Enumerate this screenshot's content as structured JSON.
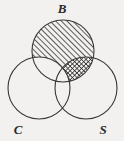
{
  "figure": {
    "type": "venn-diagram",
    "background_color": "#f2f1ef",
    "stroke_color": "#3a3836",
    "hatch_color": "#2b2a28",
    "sets": [
      {
        "id": "B",
        "label": "B",
        "label_position": "top-center",
        "label_x": 62,
        "label_y": 13,
        "circle": {
          "cx": 63,
          "cy": 51,
          "r": 31
        }
      },
      {
        "id": "C",
        "label": "C",
        "label_position": "bottom-left",
        "label_x": 18,
        "label_y": 134,
        "circle": {
          "cx": 39,
          "cy": 88,
          "r": 31
        }
      },
      {
        "id": "S",
        "label": "S",
        "label_position": "bottom-right",
        "label_x": 103,
        "label_y": 134,
        "circle": {
          "cx": 86,
          "cy": 88,
          "r": 31
        }
      }
    ],
    "shaded_regions": [
      {
        "id": "B-only-and-B-and-S",
        "description": "B minus C",
        "pattern": "diagonal-hatch",
        "pattern_angle_deg": 45,
        "pattern_spacing_px": 4
      },
      {
        "id": "B-and-S-not-C",
        "description": "B intersect S minus C",
        "pattern": "cross-hatch",
        "pattern_angle_deg": 45,
        "pattern_spacing_px": 3
      }
    ],
    "unshaded_regions": [
      {
        "id": "C-only",
        "description": "C minus B minus S"
      },
      {
        "id": "S-only",
        "description": "S minus B minus C"
      },
      {
        "id": "C-and-S-not-B",
        "description": "C intersect S minus B"
      },
      {
        "id": "B-and-C",
        "description": "B intersect C (including triple overlap)"
      }
    ]
  }
}
